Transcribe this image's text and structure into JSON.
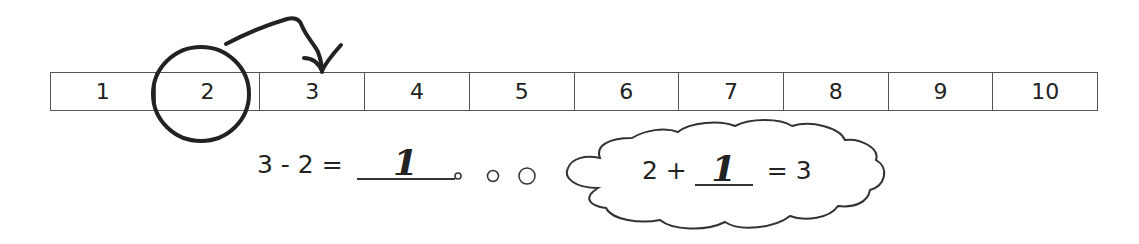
{
  "number_line": {
    "cells": [
      "1",
      "2",
      "3",
      "4",
      "5",
      "6",
      "7",
      "8",
      "9",
      "10"
    ],
    "circled_value": "2",
    "arrow_target": "3"
  },
  "subtraction": {
    "minuend": "3",
    "operator": "-",
    "subtrahend": "2",
    "equals": "=",
    "answer": "1"
  },
  "thought_bubble": {
    "addend": "2",
    "operator": "+",
    "answer": "1",
    "equals": "=",
    "sum": "3"
  },
  "colors": {
    "ink": "#222222",
    "line": "#555555",
    "background": "#ffffff"
  }
}
